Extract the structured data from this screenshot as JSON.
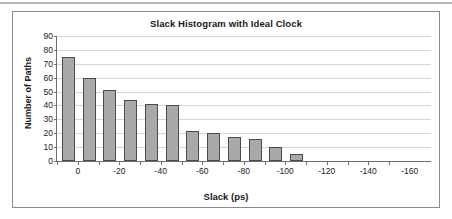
{
  "chart_data": {
    "type": "bar",
    "title": "Slack Histogram with Ideal Clock",
    "xlabel": "Slack (ps)",
    "ylabel": "Number of Paths",
    "ylim": [
      0,
      90
    ],
    "ytick_labels": [
      "90",
      "80",
      "70",
      "60",
      "50",
      "40",
      "30",
      "20",
      "10",
      "0"
    ],
    "ytick_values": [
      90,
      80,
      70,
      60,
      50,
      40,
      30,
      20,
      10,
      0
    ],
    "xtick_labels": [
      "0",
      "-20",
      "-40",
      "-60",
      "-80",
      "-100",
      "-120",
      "-140",
      "-160"
    ],
    "xtick_values": [
      0,
      -20,
      -40,
      -60,
      -80,
      -100,
      -120,
      -140,
      -160
    ],
    "grid": "horizontal",
    "legend": "none",
    "bin_width": 10,
    "categories": [
      0,
      -10,
      -20,
      -30,
      -40,
      -50,
      -60,
      -70,
      -80,
      -90,
      -100,
      -110
    ],
    "values": [
      75,
      60,
      51,
      44,
      41,
      40,
      21.5,
      20,
      17.5,
      16,
      10,
      5
    ],
    "bar_fill_color": "#a9a9a9",
    "bar_border_color": "#4a4a4a",
    "gridline_color": "#d6d6d6",
    "axis_color": "#6e6e6e"
  }
}
